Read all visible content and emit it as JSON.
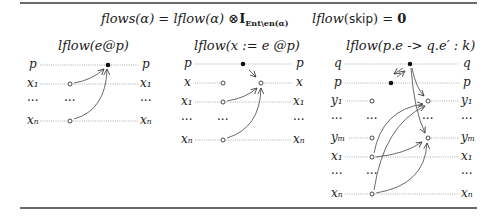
{
  "equations": {
    "flows_def": {
      "lhs": "flows(α)",
      "eq": "=",
      "rhs_fn": "lflow(α)",
      "otimes": "⊗",
      "identity": "I",
      "identity_sub": "Ent\\en(α)"
    },
    "skip_def": {
      "lhs": "lflow",
      "arg": "skip",
      "eq": "=",
      "rhs": "0"
    }
  },
  "panels": [
    {
      "title": "lflow(e@p)",
      "rows": [
        "p",
        "x1",
        "…",
        "xn"
      ],
      "left_labels": [
        "p",
        "x₁",
        "···",
        "xₙ"
      ],
      "right_labels": [
        "p",
        "x₁",
        "···",
        "xₙ"
      ],
      "mid_dots": [
        "",
        "···",
        ""
      ]
    },
    {
      "title": "lflow(x := e @p)",
      "left_labels": [
        "p",
        "x",
        "x₁",
        "···",
        "xₙ"
      ],
      "right_labels": [
        "p",
        "x",
        "x₁",
        "···",
        "xₙ"
      ],
      "mid_dots": [
        "···"
      ]
    },
    {
      "title": "lflow(p.e -> q.e′ : k)",
      "left_labels": [
        "q",
        "p",
        "y₁",
        "···",
        "yₘ",
        "x₁",
        "···",
        "xₙ"
      ],
      "right_labels": [
        "q",
        "p",
        "y₁",
        "···",
        "yₘ",
        "x₁",
        "···",
        "xₙ"
      ],
      "mid_dots": [
        "···",
        "···",
        "···"
      ]
    }
  ]
}
